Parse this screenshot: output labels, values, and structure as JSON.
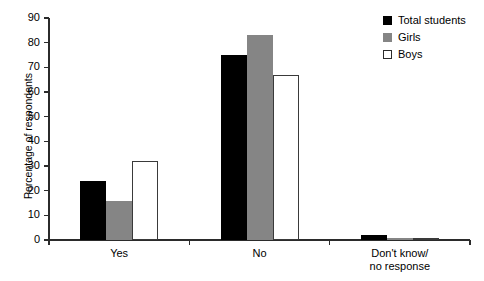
{
  "chart_data": {
    "type": "bar",
    "title": "",
    "xlabel": "",
    "ylabel": "Percentage of respondents",
    "ylim": [
      0,
      90
    ],
    "ytick_step": 10,
    "yticks": [
      0,
      10,
      20,
      30,
      40,
      50,
      60,
      70,
      80,
      90
    ],
    "grid": false,
    "legend_position": "top-right",
    "categories": [
      "Yes",
      "No",
      "Don't know/\nno response"
    ],
    "category_labels": [
      {
        "line1": "Yes",
        "line2": ""
      },
      {
        "line1": "No",
        "line2": ""
      },
      {
        "line1": "Don't know/",
        "line2": "no response"
      }
    ],
    "series": [
      {
        "name": "Total students",
        "color": "#000000",
        "values": [
          24,
          75,
          2
        ]
      },
      {
        "name": "Girls",
        "color": "#858585",
        "values": [
          16,
          83,
          1
        ]
      },
      {
        "name": "Boys",
        "color": "#ffffff",
        "values": [
          32,
          67,
          1
        ]
      }
    ]
  },
  "legend": {
    "items": [
      {
        "label": "Total students",
        "style": "total"
      },
      {
        "label": "Girls",
        "style": "girls"
      },
      {
        "label": "Boys",
        "style": "boys"
      }
    ]
  },
  "axis": {
    "y_title": "Percentage of respondents"
  }
}
